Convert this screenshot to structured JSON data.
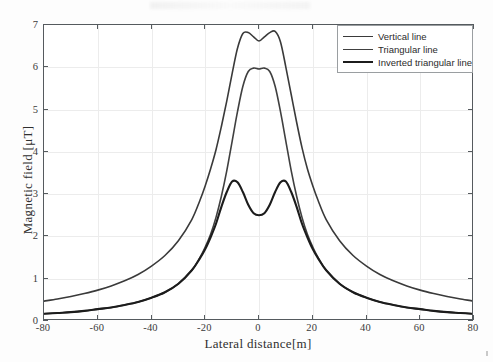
{
  "chart_data": {
    "type": "line",
    "title": "",
    "xlabel": "Lateral distance[m]",
    "ylabel": "Magnetic field [μT]",
    "xlim": [
      -80,
      80
    ],
    "ylim": [
      0,
      7
    ],
    "xticks": [
      -80,
      -60,
      -40,
      -20,
      0,
      20,
      40,
      60,
      80
    ],
    "yticks": [
      0,
      1,
      2,
      3,
      4,
      5,
      6,
      7
    ],
    "xticklabels": [
      "-80",
      "-60",
      "-40",
      "-20",
      "0",
      "20",
      "40",
      "60",
      "80"
    ],
    "yticklabels": [
      "0",
      "1",
      "2",
      "3",
      "4",
      "5",
      "6",
      "7"
    ],
    "grid": true,
    "legend_position": "top-right",
    "x": [
      -80,
      -75,
      -70,
      -65,
      -60,
      -55,
      -50,
      -45,
      -40,
      -35,
      -30,
      -25,
      -22,
      -20,
      -18,
      -16,
      -14,
      -12,
      -10,
      -8,
      -6,
      -4,
      -2,
      0,
      2,
      4,
      6,
      8,
      10,
      12,
      14,
      16,
      18,
      20,
      22,
      25,
      30,
      35,
      40,
      45,
      50,
      55,
      60,
      65,
      70,
      75,
      80
    ],
    "series": [
      {
        "name": "Vertical line",
        "color": "#3a3a3a",
        "linewidth": 1.6,
        "values": [
          0.47,
          0.52,
          0.58,
          0.65,
          0.73,
          0.83,
          0.95,
          1.1,
          1.3,
          1.55,
          1.9,
          2.4,
          2.85,
          3.2,
          3.6,
          4.05,
          4.6,
          5.2,
          5.85,
          6.45,
          6.8,
          6.82,
          6.72,
          6.62,
          6.72,
          6.82,
          6.85,
          6.6,
          6.0,
          5.35,
          4.7,
          4.1,
          3.6,
          3.2,
          2.85,
          2.4,
          1.9,
          1.55,
          1.3,
          1.1,
          0.95,
          0.83,
          0.73,
          0.65,
          0.58,
          0.52,
          0.47
        ]
      },
      {
        "name": "Triangular line",
        "color": "#404040",
        "linewidth": 1.6,
        "values": [
          0.17,
          0.19,
          0.21,
          0.24,
          0.28,
          0.32,
          0.38,
          0.45,
          0.55,
          0.68,
          0.88,
          1.2,
          1.5,
          1.75,
          2.05,
          2.45,
          2.95,
          3.55,
          4.25,
          4.95,
          5.55,
          5.9,
          5.98,
          5.96,
          5.98,
          5.9,
          5.55,
          4.95,
          4.25,
          3.55,
          2.95,
          2.45,
          2.05,
          1.75,
          1.5,
          1.2,
          0.88,
          0.68,
          0.55,
          0.45,
          0.38,
          0.32,
          0.28,
          0.24,
          0.21,
          0.19,
          0.17
        ]
      },
      {
        "name": "Inverted triangular line",
        "color": "#1c1c1c",
        "linewidth": 2.1,
        "values": [
          0.17,
          0.19,
          0.21,
          0.24,
          0.28,
          0.32,
          0.38,
          0.45,
          0.55,
          0.68,
          0.88,
          1.2,
          1.48,
          1.7,
          1.98,
          2.3,
          2.7,
          3.05,
          3.3,
          3.28,
          3.05,
          2.75,
          2.55,
          2.5,
          2.55,
          2.75,
          3.05,
          3.28,
          3.3,
          3.05,
          2.7,
          2.3,
          1.98,
          1.7,
          1.48,
          1.2,
          0.88,
          0.68,
          0.55,
          0.45,
          0.38,
          0.32,
          0.28,
          0.24,
          0.21,
          0.19,
          0.17
        ]
      }
    ],
    "annotations": {
      "peak_vertical": 6.85,
      "center_dip_vertical": 6.62,
      "peak_triangular": 5.98,
      "peak_inverted": 3.3,
      "center_dip_inverted": 2.5,
      "edge_value_vertical": 0.47,
      "edge_value_others": 0.17
    }
  },
  "legend": {
    "entries": [
      {
        "label": "Vertical line"
      },
      {
        "label": "Triangular line"
      },
      {
        "label": "Inverted triangular line"
      }
    ]
  }
}
